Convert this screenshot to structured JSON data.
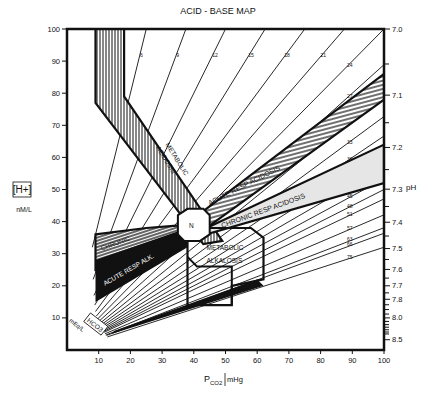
{
  "chart_data": {
    "type": "line",
    "title": "ACID - BASE MAP",
    "xlabel": "PCO2 mmHg",
    "xlabel_main": "P",
    "xlabel_sub": "CO2",
    "xlabel_unit": "mHg",
    "ylabel": "[H+] nM/L",
    "ylabel_top": "[H+]",
    "ylabel_unit": "nM/L",
    "y2label": "pH",
    "isobar_label": "HCO3",
    "isobar_unit": "mEq/L",
    "xlim": [
      0,
      100
    ],
    "ylim": [
      0,
      100
    ],
    "x_ticks": [
      10,
      20,
      30,
      40,
      50,
      60,
      70,
      80,
      90,
      100
    ],
    "y_ticks": [
      10,
      20,
      30,
      40,
      50,
      60,
      70,
      80,
      90,
      100
    ],
    "ph_ticks": [
      {
        "label": "7.0",
        "h": 100
      },
      {
        "label": "7.1",
        "h": 79.4
      },
      {
        "label": "7.2",
        "h": 63.1
      },
      {
        "label": "7.3",
        "h": 50.1
      },
      {
        "label": "7.4",
        "h": 39.8
      },
      {
        "label": "7.5",
        "h": 31.6
      },
      {
        "label": "7.6",
        "h": 25.1
      },
      {
        "label": "7.7",
        "h": 20.0
      },
      {
        "label": "7.8",
        "h": 15.8
      },
      {
        "label": "8.0",
        "h": 10.0
      },
      {
        "label": "8.5",
        "h": 3.2
      }
    ],
    "ph_minor_ticks": [
      89.1,
      70.8,
      56.2,
      44.7,
      35.5,
      28.2,
      22.4,
      17.8,
      14.1,
      12.6,
      11.2,
      8.9,
      7.9,
      7.1,
      6.3,
      5.6,
      5.0
    ],
    "hco3_isobars": [
      6,
      9,
      12,
      15,
      18,
      21,
      24,
      27,
      30,
      33,
      36,
      39,
      42,
      45,
      48,
      51,
      57,
      63,
      66,
      75
    ],
    "regions": [
      {
        "name": "METABOLIC ACIDOSIS",
        "label": "METABOLIC ACIDOSIS",
        "fill": "vertical-hatch"
      },
      {
        "name": "ACUTE RESP ACIDOSIS",
        "label": "ACUTE RESP ACIDOSIS",
        "fill": "diagonal-hatch"
      },
      {
        "name": "CHRONIC RESP ACIDOSIS",
        "label": "CHRONIC RESP ACIDOSIS",
        "fill": "light-gray"
      },
      {
        "name": "CHRONIC RESP ALK",
        "label": "CHRONIC RESP ALK",
        "fill": "horizontal-hatch"
      },
      {
        "name": "ACUTE RESP ALK",
        "label": "ACUTE RESP ALK",
        "fill": "solid-black"
      },
      {
        "name": "METABOLIC ALKALOSIS",
        "label": "METABOLIC ALKALOSIS",
        "fill": "isobar-lines"
      },
      {
        "name": "N",
        "label": "N",
        "fill": "white"
      }
    ],
    "legend": "none",
    "grid": false
  },
  "labels": {
    "title": "ACID - BASE MAP",
    "y_h": "[H+]",
    "y_unit": "nM/L",
    "ph": "pH",
    "x_p": "P",
    "x_sub": "CO2",
    "x_unit": "mHg",
    "hco3": "HCO3",
    "meq": "mEq/L",
    "met_acid_1": "METABOLIC",
    "met_acid_2": "ACIDOSIS",
    "acute_acid": "ACUTE RESP ACIDOSIS",
    "chronic_acid": "CHRONIC RESP ACIDOSIS",
    "chronic_alk_1": "CHRONIC",
    "chronic_alk_2": "RESP ALK.",
    "acute_alk": "ACUTE RESP ALK.",
    "met_alk_1": "METABOLIC",
    "met_alk_2": "ALKALOSIS",
    "normal": "N"
  }
}
